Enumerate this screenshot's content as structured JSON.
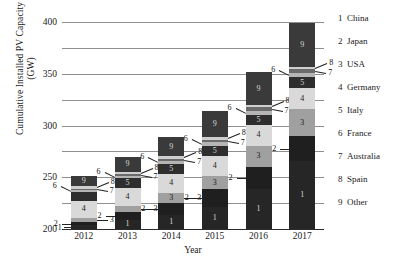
{
  "chart_data": {
    "type": "bar",
    "subtype": "stacked-column",
    "title": "",
    "xlabel": "Year",
    "ylabel": "Cumulative Installed PV Capacity (GW)",
    "categories": [
      "2012",
      "2013",
      "2014",
      "2015",
      "2016",
      "2017"
    ],
    "ylim": [
      0,
      400
    ],
    "yticks": [
      0,
      50,
      100,
      150,
      200,
      250,
      300,
      350,
      400
    ],
    "grid": "horizontal",
    "legend_position": "right",
    "series": [
      {
        "key": "1",
        "name": "China",
        "values": [
          7,
          18,
          28,
          43,
          78,
          131
        ]
      },
      {
        "key": "2",
        "name": "Japan",
        "values": [
          7,
          14,
          23,
          34,
          42,
          49
        ]
      },
      {
        "key": "3",
        "name": "USA",
        "values": [
          8,
          12,
          18,
          25,
          41,
          51
        ]
      },
      {
        "key": "4",
        "name": "Germany",
        "values": [
          33,
          36,
          38,
          40,
          41,
          42
        ]
      },
      {
        "key": "5",
        "name": "Italy",
        "values": [
          16,
          18,
          19,
          19,
          19,
          20
        ]
      },
      {
        "key": "6",
        "name": "France",
        "values": [
          4,
          5,
          6,
          7,
          8,
          9
        ]
      },
      {
        "key": "7",
        "name": "Australia",
        "values": [
          3,
          3,
          4,
          5,
          6,
          7
        ]
      },
      {
        "key": "8",
        "name": "Spain",
        "values": [
          5,
          5,
          5,
          5,
          5,
          5
        ]
      },
      {
        "key": "9",
        "name": "Other",
        "values": [
          19,
          28,
          37,
          50,
          63,
          84
        ]
      }
    ],
    "totals": [
      102,
      139,
      178,
      228,
      303,
      398
    ],
    "series_colors": [
      "#262626",
      "#1f1f1f",
      "#a0a0a0",
      "#d9d9d9",
      "#2e2e2e",
      "#b5b5b5",
      "#6b6b6b",
      "#cfcfcf",
      "#3a3a3a"
    ]
  },
  "axes": {
    "ylabel_line1": "Cumulative Installed PV Capacity",
    "ylabel_line2": "(GW)",
    "xlabel": "Year",
    "ytick_labels": [
      "400",
      "350",
      "300",
      "250",
      "200",
      "150",
      "100",
      "50",
      "0"
    ],
    "xtick_labels": [
      "2012",
      "2013",
      "2014",
      "2015",
      "2016",
      "2017"
    ]
  },
  "legend": {
    "entries": [
      {
        "num": "1",
        "name": "China"
      },
      {
        "num": "2",
        "name": "Japan"
      },
      {
        "num": "3",
        "name": "USA"
      },
      {
        "num": "4",
        "name": "Germany"
      },
      {
        "num": "5",
        "name": "Italy"
      },
      {
        "num": "6",
        "name": "France"
      },
      {
        "num": "7",
        "name": "Australia"
      },
      {
        "num": "8",
        "name": "Spain"
      },
      {
        "num": "9",
        "name": "Other"
      }
    ]
  }
}
